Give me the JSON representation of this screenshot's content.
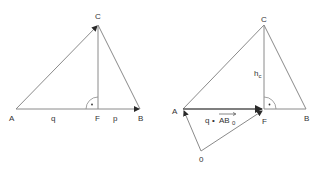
{
  "colors": {
    "line": "#8a8a8a",
    "arrow": "#2a2a2a",
    "text": "#333333",
    "background": "#ffffff"
  },
  "left_figure": {
    "points": {
      "A": {
        "x": 16,
        "y": 109,
        "label": "A"
      },
      "B": {
        "x": 140,
        "y": 109,
        "label": "B"
      },
      "C": {
        "x": 98,
        "y": 25,
        "label": "C"
      },
      "F": {
        "x": 98,
        "y": 109,
        "label": "F"
      }
    },
    "segment_labels": {
      "q": "q",
      "p": "p"
    },
    "right_angle_marker": "·"
  },
  "right_figure": {
    "points": {
      "A": {
        "x": 183,
        "y": 109,
        "label": "A"
      },
      "B": {
        "x": 306,
        "y": 109,
        "label": "B"
      },
      "C": {
        "x": 264,
        "y": 25,
        "label": "C"
      },
      "F": {
        "x": 264,
        "y": 109,
        "label": "F"
      },
      "O": {
        "x": 201,
        "y": 151,
        "label": "0"
      }
    },
    "height_label": {
      "main": "h",
      "sub": "c"
    },
    "vector_label": {
      "scalar": "q",
      "dot": "•",
      "vector": "AB",
      "sub": "0"
    },
    "right_angle_marker": "·"
  }
}
